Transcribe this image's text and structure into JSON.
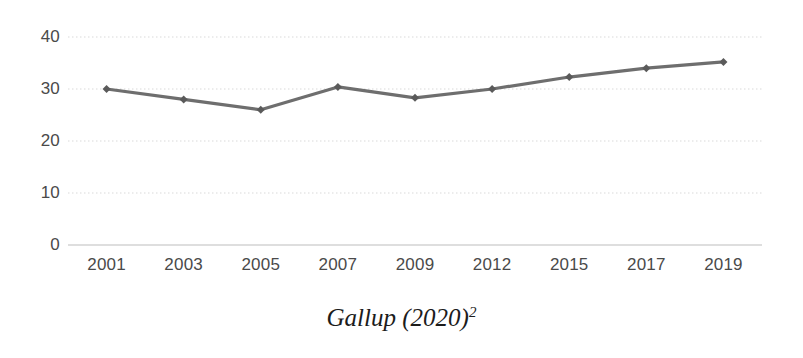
{
  "caption": {
    "text": "Gallup (2020)",
    "superscript": "2"
  },
  "chart_data": {
    "type": "line",
    "title": "",
    "subtitle": "",
    "xlabel": "",
    "ylabel": "",
    "categories": [
      "2001",
      "2003",
      "2005",
      "2007",
      "2009",
      "2012",
      "2015",
      "2017",
      "2019"
    ],
    "values": [
      30,
      28,
      26,
      30.4,
      28.3,
      30,
      32.3,
      34,
      35.2
    ],
    "series": [
      {
        "name": "",
        "values": [
          30,
          28,
          26,
          30.4,
          28.3,
          30,
          32.3,
          34,
          35.2
        ]
      }
    ],
    "ylim": [
      0,
      40
    ],
    "yticks": [
      "0",
      "10",
      "20",
      "30",
      "40"
    ],
    "ytick_values": [
      0,
      10,
      20,
      30,
      40
    ],
    "xticks": [
      "2001",
      "2003",
      "2005",
      "2007",
      "2009",
      "2012",
      "2015",
      "2017",
      "2019"
    ],
    "grid": true,
    "grid_axis": "y",
    "legend": false,
    "legend_position": "none",
    "marker": "diamond",
    "line_color": "#6e6e6e",
    "marker_color": "#5a5a5a",
    "grid_color": "#d9d9d9",
    "axis_color": "#bdbdbd",
    "tick_label_color": "#4a4a4a",
    "background_color": "#ffffff"
  }
}
